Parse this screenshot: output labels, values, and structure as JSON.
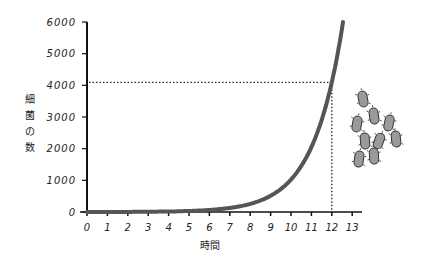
{
  "chart_data": {
    "type": "line",
    "title": "",
    "xlabel": "時間",
    "ylabel": "細菌の数",
    "x_ticks": [
      "0",
      "1",
      "2",
      "3",
      "4",
      "5",
      "6",
      "7",
      "8",
      "9",
      "10",
      "11",
      "12",
      "13"
    ],
    "y_ticks": [
      "0",
      "1000",
      "2000",
      "3000",
      "4000",
      "5000",
      "6000"
    ],
    "xlim": [
      0,
      13
    ],
    "ylim": [
      0,
      6000
    ],
    "grid": false,
    "legend": null,
    "series": [
      {
        "name": "細菌の数",
        "x": [
          0,
          1,
          2,
          3,
          4,
          5,
          6,
          7,
          8,
          9,
          10,
          11,
          12,
          12.55
        ],
        "values": [
          1,
          2,
          4,
          8,
          16,
          32,
          64,
          128,
          256,
          512,
          1024,
          2048,
          4096,
          6000
        ]
      }
    ],
    "annotations": [
      {
        "type": "dotted-guide",
        "x": 12,
        "y": 4096,
        "description": "dotted lines from x=12 up to curve and across to y-axis at ~4100"
      },
      {
        "type": "illustration",
        "description": "cluster of 9 gray bacteria drawings to the right of the curve"
      }
    ],
    "colors": {
      "curve": "#555555",
      "axis": "#111111",
      "bacteria_fill": "#9a9a9a",
      "bacteria_outline": "#333333"
    }
  }
}
